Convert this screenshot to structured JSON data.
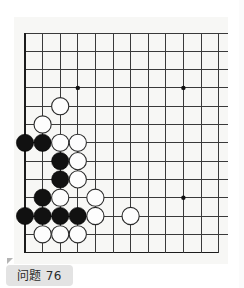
{
  "page": {
    "background_color": "#ffffff",
    "board_background_color": "#f7f7f5"
  },
  "caption": {
    "label": "问题 76",
    "problem_number": "76",
    "background_color": "#e3e3e3",
    "text_color": "#2b2b2b"
  },
  "board": {
    "type": "go-board",
    "visible_columns": 12,
    "visible_rows": 13,
    "origin_x": 11,
    "origin_y": 16,
    "cell_width": 17.6,
    "cell_height": 18.3,
    "line_color": "#3a3a3a",
    "edge_line_color": "#1c1c1c",
    "black_stone_color": "#111111",
    "white_stone_color": "#fdfdfd",
    "stone_radius": 8.6,
    "star_points": [
      {
        "col": 3,
        "row": 3
      },
      {
        "col": 9,
        "row": 3
      },
      {
        "col": 9,
        "row": 9
      }
    ],
    "stones": [
      {
        "color": "white",
        "col": 2,
        "row": 4
      },
      {
        "color": "white",
        "col": 1,
        "row": 5
      },
      {
        "color": "black",
        "col": 0,
        "row": 6
      },
      {
        "color": "black",
        "col": 1,
        "row": 6
      },
      {
        "color": "white",
        "col": 2,
        "row": 6
      },
      {
        "color": "white",
        "col": 3,
        "row": 6
      },
      {
        "color": "black",
        "col": 2,
        "row": 7
      },
      {
        "color": "white",
        "col": 3,
        "row": 7
      },
      {
        "color": "black",
        "col": 2,
        "row": 8
      },
      {
        "color": "white",
        "col": 3,
        "row": 8
      },
      {
        "color": "black",
        "col": 1,
        "row": 9
      },
      {
        "color": "white",
        "col": 2,
        "row": 9
      },
      {
        "color": "white",
        "col": 4,
        "row": 9
      },
      {
        "color": "black",
        "col": 0,
        "row": 10
      },
      {
        "color": "black",
        "col": 1,
        "row": 10
      },
      {
        "color": "black",
        "col": 2,
        "row": 10
      },
      {
        "color": "black",
        "col": 3,
        "row": 10
      },
      {
        "color": "white",
        "col": 4,
        "row": 10
      },
      {
        "color": "white",
        "col": 6,
        "row": 10
      },
      {
        "color": "white",
        "col": 1,
        "row": 11
      },
      {
        "color": "white",
        "col": 2,
        "row": 11
      },
      {
        "color": "white",
        "col": 3,
        "row": 11
      }
    ],
    "black_stone_count": 10,
    "white_stone_count": 12
  }
}
